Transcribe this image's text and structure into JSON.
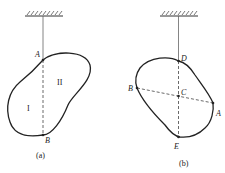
{
  "figures": [
    {
      "caption": "(a)",
      "points": {
        "A": "A",
        "B": "B"
      },
      "regions": {
        "one": "I",
        "two": "II"
      }
    },
    {
      "caption": "(b)",
      "points": {
        "D": "D",
        "B": "B",
        "C": "C",
        "A": "A",
        "E": "E"
      }
    }
  ]
}
